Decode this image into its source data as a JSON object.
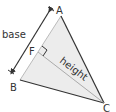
{
  "diagram": {
    "type": "triangle-base-height",
    "vertices": {
      "A": {
        "label": "A",
        "x": 61,
        "y": 16
      },
      "B": {
        "label": "B",
        "x": 20,
        "y": 80
      },
      "C": {
        "label": "C",
        "x": 104,
        "y": 103
      },
      "F": {
        "label": "F",
        "x": 38,
        "y": 52
      }
    },
    "labels": {
      "base": "base",
      "height": "height",
      "A": "A",
      "B": "B",
      "C": "C",
      "F": "F"
    },
    "colors": {
      "fill": "#ececec",
      "stroke": "#333333",
      "height_line": "#999999"
    }
  }
}
